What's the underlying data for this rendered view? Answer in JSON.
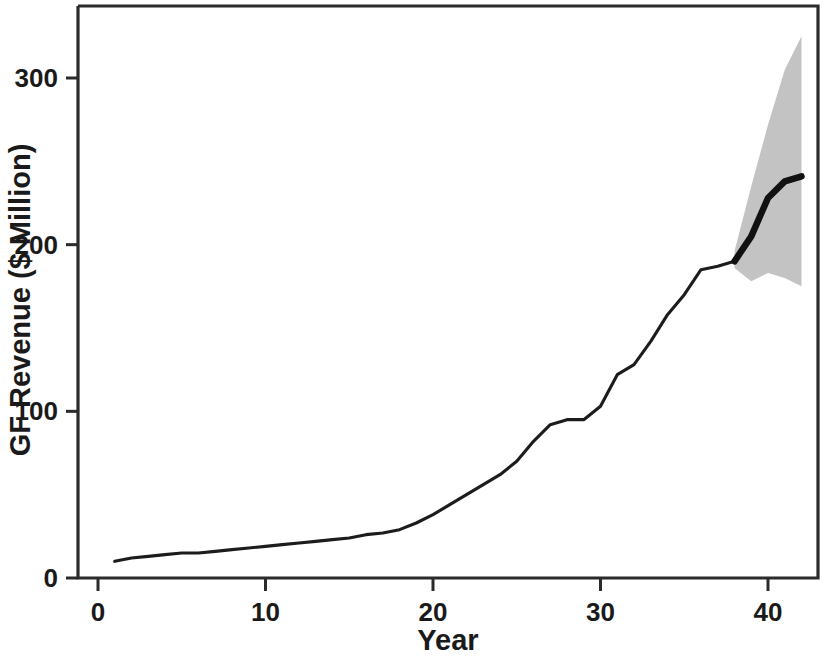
{
  "figure": {
    "background_color": "#ffffff",
    "line_color": "#1c1c1c",
    "band_color": "#c3c3c3",
    "axis_color": "#2b2b2b"
  },
  "axes": {
    "x_title": "Year",
    "y_title": "GF Revenue ($ Million)",
    "x_ticks": [
      "0",
      "10",
      "20",
      "30",
      "40"
    ],
    "y_ticks": [
      "0",
      "100",
      "200",
      "300"
    ]
  },
  "chart_data": {
    "type": "line",
    "title": "",
    "subtitle": "",
    "xlabel": "Year",
    "ylabel": "GF Revenue ($ Million)",
    "xlim": [
      -0.5,
      43.5
    ],
    "ylim": [
      -5,
      345
    ],
    "xticks": [
      0,
      10,
      20,
      30,
      40
    ],
    "yticks": [
      0,
      100,
      200,
      300
    ],
    "grid": false,
    "legend": "none",
    "annotations": [],
    "series": [
      {
        "name": "Historical GF Revenue",
        "style": "thin-solid-line",
        "color": "#1c1c1c",
        "x": [
          1,
          2,
          3,
          4,
          5,
          6,
          7,
          8,
          9,
          10,
          11,
          12,
          13,
          14,
          15,
          16,
          17,
          18,
          19,
          20,
          21,
          22,
          23,
          24,
          25,
          26,
          27,
          28,
          29,
          30,
          31,
          32,
          33,
          34,
          35,
          36,
          37,
          38
        ],
        "values": [
          10,
          12,
          13,
          14,
          15,
          15,
          16,
          17,
          18,
          19,
          20,
          21,
          22,
          23,
          24,
          26,
          27,
          29,
          33,
          38,
          44,
          50,
          56,
          62,
          70,
          82,
          92,
          95,
          95,
          103,
          122,
          128,
          142,
          158,
          170,
          185,
          187,
          190
        ]
      },
      {
        "name": "Forecast GF Revenue",
        "style": "thick-solid-line",
        "color": "#111111",
        "x": [
          38,
          39,
          40,
          41,
          42
        ],
        "values": [
          190,
          205,
          228,
          238,
          241
        ]
      },
      {
        "name": "Forecast interval upper bound",
        "style": "shaded-band-edge",
        "color": "#c3c3c3",
        "x": [
          38,
          39,
          40,
          41,
          42
        ],
        "values": [
          196,
          235,
          272,
          305,
          325
        ]
      },
      {
        "name": "Forecast interval lower bound",
        "style": "shaded-band-edge",
        "color": "#c3c3c3",
        "x": [
          38,
          39,
          40,
          41,
          42
        ],
        "values": [
          186,
          178,
          183,
          180,
          175
        ]
      }
    ]
  }
}
